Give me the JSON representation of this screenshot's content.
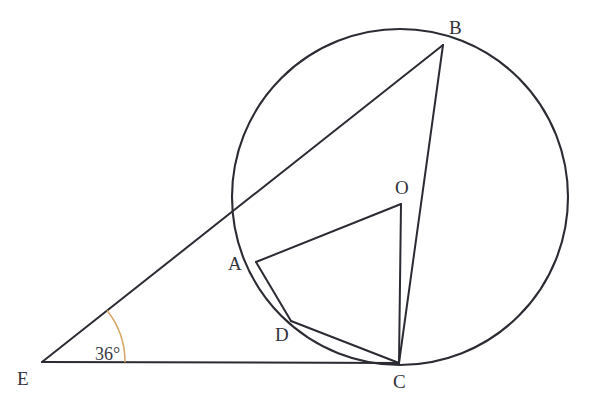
{
  "figure": {
    "type": "geometry-diagram",
    "background_color": "#ffffff",
    "line_color": "#2b2b33",
    "arc_marker_color": "#d9a86c",
    "label_color": "#33333b"
  },
  "labels": {
    "A": "A",
    "B": "B",
    "C": "C",
    "D": "D",
    "E": "E",
    "O": "O",
    "angle_E": "36°"
  },
  "points": {
    "A": {
      "x": 256,
      "y": 262
    },
    "B": {
      "x": 443,
      "y": 45
    },
    "C": {
      "x": 399,
      "y": 363
    },
    "D": {
      "x": 291,
      "y": 321
    },
    "E": {
      "x": 42,
      "y": 362
    },
    "O": {
      "x": 401,
      "y": 204
    }
  },
  "label_positions": {
    "A": {
      "x": 228,
      "y": 270
    },
    "B": {
      "x": 449,
      "y": 34
    },
    "C": {
      "x": 393,
      "y": 388
    },
    "D": {
      "x": 275,
      "y": 341
    },
    "E": {
      "x": 17,
      "y": 385
    },
    "O": {
      "x": 395,
      "y": 194
    },
    "angle_E": {
      "x": 95,
      "y": 360
    }
  },
  "circle": {
    "center_x": 400,
    "center_y": 197,
    "radius": 168
  },
  "segments": [
    {
      "name": "EB",
      "from": "E",
      "to": "B"
    },
    {
      "name": "EC",
      "from": "E",
      "to": "C"
    },
    {
      "name": "AB",
      "from": "A",
      "to": "B"
    },
    {
      "name": "AO",
      "from": "A",
      "to": "O"
    },
    {
      "name": "AD",
      "from": "A",
      "to": "D"
    },
    {
      "name": "DC",
      "from": "D",
      "to": "C"
    },
    {
      "name": "OC",
      "from": "O",
      "to": "C"
    },
    {
      "name": "BC",
      "from": "B",
      "to": "C"
    }
  ],
  "angle_marker": {
    "at": "E",
    "value": "36°",
    "radius": 83
  }
}
